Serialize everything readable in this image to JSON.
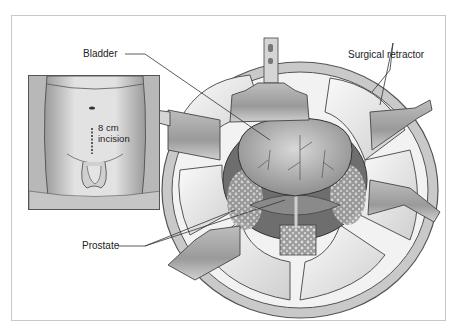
{
  "figure": {
    "labels": {
      "bladder": "Bladder",
      "surgical_retractor": "Surgical retractor",
      "prostate": "Prostate"
    },
    "inset": {
      "incision_length": "8 cm",
      "incision_word": "incision"
    },
    "colors": {
      "frame_border": "#c8c8c8",
      "line_art": "#333333",
      "tissue_mid": "#9a9a9a",
      "tissue_light": "#e6e6e6",
      "background": "#ffffff"
    }
  }
}
